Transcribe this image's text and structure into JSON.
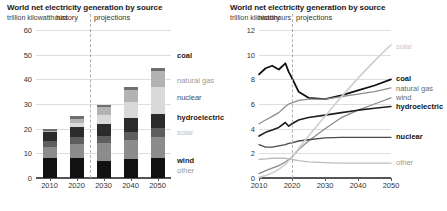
{
  "left": {
    "title": "World net electricity generation by source",
    "subtitle": "trillion kilowatthours",
    "history_label": "history",
    "projections_label": "projections",
    "chart_data": {
      "type": "bar",
      "title": "World net electricity generation by source",
      "ylabel": "trillion kilowatthours",
      "xlabel": "",
      "ylim": [
        0,
        60
      ],
      "yticks": [
        0,
        10,
        20,
        30,
        40,
        50,
        60
      ],
      "categories": [
        "2010",
        "2020",
        "2030",
        "2040",
        "2050"
      ],
      "grid": true,
      "stacked": true,
      "divider_year": 2025,
      "series": [
        {
          "name": "coal",
          "color": "#111111",
          "values": [
            8.0,
            8.2,
            7.0,
            7.6,
            8.0
          ]
        },
        {
          "name": "natural gas",
          "color": "#8c8c8c",
          "values": [
            4.5,
            5.6,
            7.0,
            8.0,
            8.8
          ]
        },
        {
          "name": "nuclear",
          "color": "#5e5e5e",
          "values": [
            2.7,
            2.8,
            3.0,
            3.2,
            3.4
          ]
        },
        {
          "name": "hydroelectric",
          "color": "#2b2b2b",
          "values": [
            3.4,
            4.2,
            5.0,
            5.4,
            5.8
          ]
        },
        {
          "name": "solar",
          "color": "#d9d9d9",
          "values": [
            0.2,
            1.6,
            3.6,
            6.6,
            10.8
          ]
        },
        {
          "name": "wind",
          "color": "#b3b3b3",
          "values": [
            0.4,
            1.6,
            3.0,
            4.8,
            6.5
          ]
        },
        {
          "name": "other",
          "color": "#6f6f6f",
          "values": [
            0.8,
            1.0,
            1.1,
            1.2,
            1.3
          ]
        }
      ],
      "totals": [
        20.0,
        25.0,
        29.7,
        36.8,
        44.6
      ]
    },
    "legend": [
      {
        "label": "other",
        "color": "#9a9a9a",
        "bold": false
      },
      {
        "label": "wind",
        "color": "#1a1a1a",
        "bold": true
      },
      {
        "label": "solar",
        "color": "#c0c0c0",
        "bold": false
      },
      {
        "label": "hydroelectric",
        "color": "#1a1a1a",
        "bold": true
      },
      {
        "label": "nuclear",
        "color": "#4a4a4a",
        "bold": false
      },
      {
        "label": "natural gas",
        "color": "#9a9a9a",
        "bold": false
      },
      {
        "label": "coal",
        "color": "#1a1a1a",
        "bold": true
      }
    ]
  },
  "right": {
    "title": "World net electricity generation by source",
    "subtitle": "trillion kilowatthours",
    "history_label": "history",
    "projections_label": "projections",
    "chart_data": {
      "type": "line",
      "title": "World net electricity generation by source",
      "ylabel": "trillion kilowatthours",
      "xlabel": "",
      "ylim": [
        0,
        12
      ],
      "yticks": [
        0,
        2,
        4,
        6,
        8,
        10,
        12
      ],
      "xlim": [
        2010,
        2050
      ],
      "xticks": [
        2010,
        2020,
        2030,
        2040,
        2050
      ],
      "grid": true,
      "divider_year": 2020,
      "x": [
        2010,
        2012,
        2014,
        2016,
        2018,
        2019,
        2020,
        2022,
        2025,
        2030,
        2035,
        2040,
        2045,
        2050
      ],
      "series": [
        {
          "name": "coal",
          "color": "#111111",
          "width": 1.8,
          "values": [
            8.4,
            8.9,
            9.1,
            8.8,
            9.3,
            8.6,
            8.1,
            7.0,
            6.5,
            6.4,
            6.7,
            7.1,
            7.5,
            8.0
          ]
        },
        {
          "name": "natural gas",
          "color": "#8c8c8c",
          "width": 1.3,
          "values": [
            4.4,
            4.7,
            5.0,
            5.3,
            5.8,
            6.0,
            6.1,
            6.3,
            6.4,
            6.4,
            6.6,
            6.8,
            7.0,
            7.3
          ]
        },
        {
          "name": "wind",
          "color": "#8c8c8c",
          "width": 1.3,
          "values": [
            0.35,
            0.6,
            0.8,
            1.0,
            1.3,
            1.5,
            1.7,
            2.3,
            3.0,
            4.0,
            4.9,
            5.5,
            6.0,
            6.5
          ]
        },
        {
          "name": "hydroelectric",
          "color": "#1f1f1f",
          "width": 1.6,
          "values": [
            3.4,
            3.7,
            3.9,
            4.1,
            4.5,
            4.2,
            4.4,
            4.7,
            4.9,
            5.1,
            5.3,
            5.5,
            5.65,
            5.8
          ]
        },
        {
          "name": "nuclear",
          "color": "#4a4a4a",
          "width": 1.3,
          "values": [
            2.7,
            2.5,
            2.5,
            2.6,
            2.7,
            2.8,
            2.85,
            3.0,
            3.1,
            3.25,
            3.3,
            3.3,
            3.3,
            3.3
          ]
        },
        {
          "name": "solar",
          "color": "#cfcfcf",
          "width": 1.6,
          "values": [
            0.05,
            0.2,
            0.4,
            0.7,
            1.1,
            1.4,
            1.7,
            2.4,
            3.4,
            5.0,
            6.6,
            8.1,
            9.5,
            10.8
          ]
        },
        {
          "name": "other",
          "color": "#bdbdbd",
          "width": 1.3,
          "values": [
            1.5,
            1.55,
            1.6,
            1.6,
            1.6,
            1.55,
            1.5,
            1.4,
            1.3,
            1.25,
            1.2,
            1.2,
            1.2,
            1.2
          ]
        }
      ]
    },
    "legend": [
      {
        "label": "solar",
        "color": "#c8c8c8",
        "bold": false
      },
      {
        "label": "coal",
        "color": "#111111",
        "bold": true
      },
      {
        "label": "natural gas",
        "color": "#6a6a6a",
        "bold": false
      },
      {
        "label": "wind",
        "color": "#6a6a6a",
        "bold": false
      },
      {
        "label": "hydroelectric",
        "color": "#111111",
        "bold": true
      },
      {
        "label": "nuclear",
        "color": "#111111",
        "bold": true
      },
      {
        "label": "other",
        "color": "#9a9a9a",
        "bold": false
      }
    ]
  }
}
